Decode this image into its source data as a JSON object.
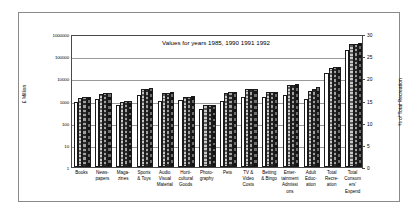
{
  "chart_data": {
    "type": "bar",
    "title": "Values for years 1985, 1990 1991 1992",
    "xlabel": "",
    "ylabel": "£ Million",
    "y2label": "% of Total Recreation",
    "yscale": "log",
    "ylim": [
      1,
      1000000
    ],
    "yticks": [
      "1",
      "10",
      "100",
      "1000",
      "10000",
      "100000",
      "1000000"
    ],
    "y2lim": [
      0,
      30
    ],
    "y2ticks": [
      "0",
      "5",
      "10",
      "15",
      "20",
      "25",
      "30"
    ],
    "grid": true,
    "legend": "none",
    "categories": [
      "Books",
      "News-\npapers",
      "Maga-\nzines",
      "Sports\n& Toys",
      "Audio\nVisual\nMaterial",
      "Horti-\ncultural\nGoods",
      "Photo-\ngraphy",
      "Pets",
      "TV &\nVideo\nCosts",
      "Betting\n& Bingo",
      "Enter-\ntainment\nAdmissi\nons",
      "Adult\nEduc-\nation",
      "Total\nRecre-\nation",
      "Total\nConsum\ners'\nExpend"
    ],
    "series": [
      {
        "name": "1985",
        "values": [
          820,
          1150,
          620,
          1700,
          1000,
          1050,
          430,
          950,
          1400,
          1500,
          1700,
          1150,
          18000,
          200000
        ]
      },
      {
        "name": "1990",
        "values": [
          1350,
          2000,
          900,
          3300,
          2100,
          1400,
          600,
          2200,
          3200,
          2300,
          5000,
          2600,
          30000,
          350000
        ]
      },
      {
        "name": "1991",
        "values": [
          1400,
          2100,
          950,
          3400,
          2200,
          1500,
          610,
          2400,
          3300,
          2400,
          5200,
          3300,
          32000,
          370000
        ]
      },
      {
        "name": "1992",
        "values": [
          1500,
          2200,
          1000,
          3500,
          2300,
          1600,
          620,
          2500,
          3400,
          2450,
          5400,
          3900,
          34000,
          380000
        ]
      }
    ],
    "percent_series": [
      {
        "name": "1985-pct",
        "values": [
          4.3,
          10.0,
          3.0,
          13.5,
          4.5,
          4.5,
          2.0,
          7.0,
          10.2,
          12.5,
          14.5,
          9.5,
          21.0,
          27.0
        ]
      },
      {
        "name": "1990-pct",
        "values": [
          4.5,
          7.3,
          2.3,
          13.6,
          6.8,
          4.6,
          1.6,
          7.2,
          10.3,
          9.8,
          14.8,
          10.0,
          21.2,
          27.3
        ]
      },
      {
        "name": "1991-pct",
        "values": [
          4.4,
          7.2,
          2.3,
          13.6,
          6.7,
          4.6,
          1.6,
          7.1,
          10.3,
          9.9,
          14.8,
          9.9,
          21.3,
          27.4
        ]
      },
      {
        "name": "1992-pct",
        "values": [
          4.6,
          7.3,
          2.4,
          13.7,
          6.9,
          4.7,
          1.6,
          7.2,
          10.4,
          10.0,
          14.9,
          10.1,
          21.5,
          27.5
        ]
      }
    ]
  },
  "colors": {
    "series_1985": "#ffffff",
    "series_1990": "#c9c9c9",
    "series_1991": "#a0a0a0",
    "series_1992": "#6e6e6e",
    "grid": "#9a9a9a",
    "axis": "#4a4a4a",
    "frame": "#8a8a8a",
    "text": "#000000"
  }
}
